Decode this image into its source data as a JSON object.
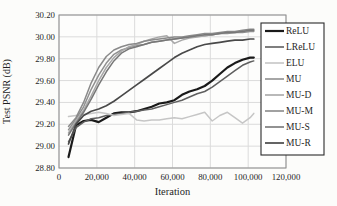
{
  "figure": {
    "background": "#fcfcfa",
    "plot_background": "#fdfdfc",
    "frame_color": "#8c8c8c",
    "grid_color": "#dbdbdb",
    "text_color": "#1f1f1f",
    "legend_border_color": "#2a2a2a"
  },
  "chart_data": {
    "type": "line",
    "title": "",
    "xlabel": "Iteration",
    "ylabel": "Test PSNR (dB)",
    "xlim": [
      0,
      120000
    ],
    "ylim": [
      28.8,
      30.2
    ],
    "grid": true,
    "legend_position": "right",
    "x_ticks": [
      0,
      20000,
      40000,
      60000,
      80000,
      100000,
      120000
    ],
    "x_tick_labels": [
      "0",
      "20,000",
      "40,000",
      "60,000",
      "80,000",
      "100,000",
      "120,000"
    ],
    "y_ticks": [
      28.8,
      29.0,
      29.2,
      29.4,
      29.6,
      29.8,
      30.0,
      30.2
    ],
    "y_tick_labels": [
      "28.80",
      "29.00",
      "29.20",
      "29.40",
      "29.60",
      "29.80",
      "30.00",
      "30.20"
    ],
    "x": [
      5000,
      9000,
      13000,
      17000,
      21000,
      25000,
      29000,
      33000,
      37000,
      41000,
      45000,
      49000,
      53000,
      57000,
      61000,
      65000,
      69000,
      73000,
      77000,
      81000,
      85000,
      89000,
      93000,
      97000,
      101000,
      103000
    ],
    "series": [
      {
        "name": "ReLU",
        "color": "#1a1a1a",
        "width": 2.2,
        "values": [
          28.9,
          29.19,
          29.23,
          29.24,
          29.22,
          29.26,
          29.3,
          29.31,
          29.31,
          29.32,
          29.34,
          29.36,
          29.39,
          29.4,
          29.42,
          29.47,
          29.5,
          29.52,
          29.55,
          29.6,
          29.66,
          29.72,
          29.76,
          29.79,
          29.81,
          29.81
        ]
      },
      {
        "name": "LReLU",
        "color": "#5f5f5f",
        "width": 1.5,
        "values": [
          29.04,
          29.17,
          29.22,
          29.25,
          29.26,
          29.28,
          29.29,
          29.3,
          29.31,
          29.32,
          29.33,
          29.34,
          29.36,
          29.38,
          29.4,
          29.42,
          29.45,
          29.48,
          29.5,
          29.54,
          29.59,
          29.64,
          29.69,
          29.74,
          29.77,
          29.78
        ]
      },
      {
        "name": "ELU",
        "color": "#c6c6c6",
        "width": 1.5,
        "values": [
          29.27,
          29.28,
          29.29,
          29.3,
          29.31,
          29.3,
          29.28,
          29.29,
          29.3,
          29.24,
          29.23,
          29.24,
          29.24,
          29.25,
          29.26,
          29.25,
          29.27,
          29.29,
          29.31,
          29.23,
          29.28,
          29.31,
          29.26,
          29.21,
          29.26,
          29.3
        ]
      },
      {
        "name": "MU",
        "color": "#909090",
        "width": 1.5,
        "values": [
          29.15,
          29.25,
          29.36,
          29.52,
          29.65,
          29.76,
          29.84,
          29.88,
          29.9,
          29.92,
          29.93,
          29.95,
          29.96,
          29.97,
          29.98,
          29.99,
          30.0,
          30.01,
          30.01,
          30.02,
          30.03,
          30.03,
          30.04,
          30.04,
          30.05,
          30.05
        ]
      },
      {
        "name": "MU-D",
        "color": "#a8a8a8",
        "width": 1.5,
        "values": [
          29.12,
          29.23,
          29.33,
          29.46,
          29.6,
          29.72,
          29.81,
          29.87,
          29.91,
          29.93,
          29.96,
          29.98,
          30.0,
          30.01,
          29.94,
          29.97,
          29.99,
          30.0,
          30.01,
          30.02,
          30.03,
          30.04,
          30.04,
          30.05,
          30.06,
          30.06
        ]
      },
      {
        "name": "MU-M",
        "color": "#8a8a8a",
        "width": 1.5,
        "values": [
          29.18,
          29.26,
          29.4,
          29.58,
          29.72,
          29.82,
          29.88,
          29.91,
          29.93,
          29.94,
          29.96,
          29.97,
          29.98,
          29.99,
          30.0,
          30.0,
          30.01,
          30.02,
          30.03,
          30.03,
          30.04,
          30.05,
          30.05,
          30.06,
          30.07,
          30.07
        ]
      },
      {
        "name": "MU-S",
        "color": "#777777",
        "width": 1.5,
        "values": [
          29.1,
          29.21,
          29.31,
          29.43,
          29.56,
          29.68,
          29.78,
          29.85,
          29.89,
          29.91,
          29.93,
          29.95,
          29.96,
          29.97,
          29.98,
          29.99,
          30.0,
          30.01,
          30.02,
          30.02,
          30.03,
          30.04,
          30.04,
          30.05,
          30.06,
          30.06
        ]
      },
      {
        "name": "MU-R",
        "color": "#494949",
        "width": 1.7,
        "values": [
          29.02,
          29.2,
          29.28,
          29.32,
          29.34,
          29.37,
          29.41,
          29.46,
          29.51,
          29.56,
          29.61,
          29.66,
          29.71,
          29.76,
          29.81,
          29.85,
          29.88,
          29.91,
          29.93,
          29.94,
          29.95,
          29.96,
          29.97,
          29.97,
          29.98,
          29.98
        ]
      }
    ]
  }
}
